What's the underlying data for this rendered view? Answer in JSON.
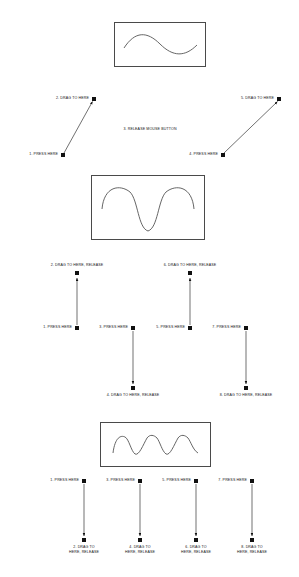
{
  "document": {
    "title": "Mouse Gesture Waveform Drawing Instructions"
  },
  "sections": [
    {
      "id": "section-1",
      "box": {
        "name": "waveform-box-single-sine"
      },
      "labels": [
        {
          "name": "label-press-1",
          "text": "1. PRESS HERE"
        },
        {
          "name": "label-drag-2",
          "text": "2. DRAG TO HERE"
        },
        {
          "name": "label-release-3",
          "text": "3. RELEASE MOUSE BUTTON"
        },
        {
          "name": "label-press-4",
          "text": "4. PRESS HERE"
        },
        {
          "name": "label-drag-5",
          "text": "5. DRAG TO HERE"
        }
      ]
    },
    {
      "id": "section-2",
      "box": {
        "name": "waveform-box-double-wave"
      },
      "labels": [
        {
          "name": "label-drag-2",
          "text": "2. DRAG TO HERE, RELEASE"
        },
        {
          "name": "label-drag-6",
          "text": "6. DRAG TO HERE, RELEASE"
        },
        {
          "name": "label-press-1",
          "text": "1. PRESS HERE"
        },
        {
          "name": "label-press-3",
          "text": "3. PRESS HERE"
        },
        {
          "name": "label-press-5",
          "text": "5. PRESS HERE"
        },
        {
          "name": "label-press-7",
          "text": "7. PRESS HERE"
        },
        {
          "name": "label-drag-4",
          "text": "4. DRAG TO HERE, RELEASE"
        },
        {
          "name": "label-drag-8",
          "text": "8. DRAG TO HERE, RELEASE"
        }
      ]
    },
    {
      "id": "section-3",
      "box": {
        "name": "waveform-box-sawtooth"
      },
      "labels": [
        {
          "name": "label-press-1",
          "text": "1. PRESS HERE"
        },
        {
          "name": "label-press-3",
          "text": "3. PRESS HERE"
        },
        {
          "name": "label-press-5",
          "text": "5. PRESS HERE"
        },
        {
          "name": "label-press-7",
          "text": "7. PRESS HERE"
        },
        {
          "name": "label-drag-2-line1",
          "text": "2. DRAG TO"
        },
        {
          "name": "label-drag-2-line2",
          "text": "HERE, RELEASE"
        },
        {
          "name": "label-drag-4-line1",
          "text": "4. DRAG TO"
        },
        {
          "name": "label-drag-4-line2",
          "text": "HERE, RELEASE"
        },
        {
          "name": "label-drag-6-line1",
          "text": "6. DRAG TO"
        },
        {
          "name": "label-drag-6-line2",
          "text": "HERE, RELEASE"
        },
        {
          "name": "label-drag-8-line1",
          "text": "8. DRAG TO"
        },
        {
          "name": "label-drag-8-line2",
          "text": "HERE, RELEASE"
        }
      ]
    }
  ],
  "colors": {
    "ink": "#111111",
    "box_border": "#4a4a4a",
    "curve": "#555555",
    "background": "#ffffff"
  }
}
